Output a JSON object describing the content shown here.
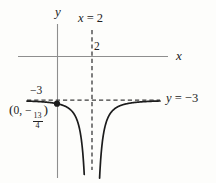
{
  "figure": {
    "background": "#fdfdfb",
    "axis_color": "#8e8e8e",
    "curve_color": "#1c1c1c",
    "dash_color": "#3b3b3b",
    "text_color": "#222222"
  },
  "labels": {
    "y_axis": "y",
    "x_axis": "x",
    "vertical_asymptote": {
      "var": "x",
      "rest": " = 2"
    },
    "horizontal_asymptote": {
      "var": "y",
      "rest": " = −3"
    },
    "x_tick": "2",
    "y_tick": "−3",
    "point": {
      "open": "(",
      "body": "0, −",
      "frac_num": "13",
      "frac_den": "4",
      "close": ")"
    }
  },
  "chart_data": {
    "type": "line",
    "function": "y = -3 - 1/(x-2)^2",
    "vertical_asymptote_x": 2,
    "horizontal_asymptote_y": -3,
    "marked_point": {
      "x": 0,
      "y": -3.25,
      "label": "(0, −13/4)"
    },
    "x_tick_values": [
      2
    ],
    "y_tick_values": [
      -3
    ],
    "branches": [
      {
        "x_start": -1.714,
        "x_end": 1.64
      },
      {
        "x_start": 2.36,
        "x_end": 5.886
      }
    ],
    "xlim": [
      -2.23,
      6.34
    ],
    "ylim": [
      -8.3,
      2.2
    ],
    "grid": false,
    "legend": false,
    "axis_arrows": false
  }
}
